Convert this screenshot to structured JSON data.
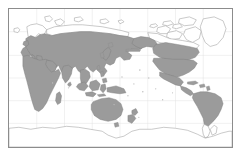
{
  "figure": {
    "kind": "distribution-map",
    "projection": "pacific-centered world map",
    "title": "",
    "caption": "",
    "has_axis_labels": false,
    "has_legend": false,
    "has_text_labels": false
  },
  "frame": {
    "border_color": "#8c8c8c",
    "background_color": "#ffffff",
    "left": 8,
    "top": 8,
    "width": 225,
    "height": 140
  },
  "style": {
    "range_fill": "#9b9b9b",
    "range_outline": "#7e7e7e",
    "land_fill": "#ffffff",
    "land_outline": "#9d9d9d",
    "graticule_color": "#e2e2e2",
    "page_background": "#ffffff"
  },
  "chart_data": {
    "type": "map",
    "title": "",
    "xlabel": "",
    "ylabel": "",
    "legend": [
      {
        "swatch": "#9b9b9b",
        "label": "Range / distribution (shaded)"
      },
      {
        "swatch": "#ffffff",
        "label": "Outside range (unshaded)"
      }
    ],
    "regions_shaded": [
      "Europe (south of Scandinavia)",
      "Africa (entire continent)",
      "Madagascar",
      "Middle East",
      "Central Asia",
      "Siberia (south of Arctic coast)",
      "India",
      "China",
      "Japan",
      "Southeast Asia",
      "Indonesia",
      "New Guinea",
      "Australia",
      "New Zealand",
      "Alaska",
      "Canada (mainland, south of Arctic)",
      "United States (contiguous)",
      "Mexico",
      "Central America",
      "Caribbean",
      "South America (north of Patagonia)"
    ],
    "regions_unshaded": [
      "Greenland",
      "Canadian Arctic Archipelago",
      "Svalbard",
      "Novaya Zemlya",
      "Arctic coastal Siberia",
      "Iceland",
      "Northern Scandinavia",
      "Southern Patagonia",
      "Antarctica"
    ]
  }
}
